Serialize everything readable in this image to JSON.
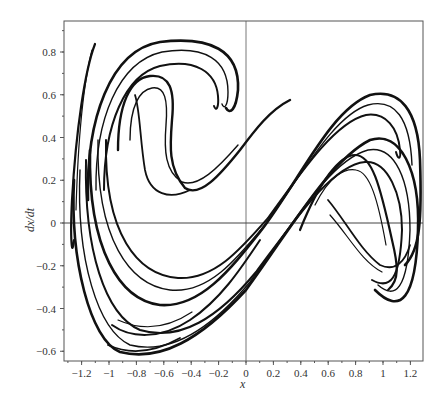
{
  "chart_data": {
    "type": "line",
    "title": "",
    "xlabel": "x",
    "ylabel": "dx/dt",
    "xlim": [
      -1.32,
      1.3
    ],
    "ylim": [
      -0.65,
      0.95
    ],
    "grid": false,
    "legend": null,
    "x_ticks": [
      "-1.2",
      "-1",
      "-0.8",
      "-0.6",
      "-0.4",
      "-0.2",
      "0",
      "0.2",
      "0.4",
      "0.6",
      "0.8",
      "1",
      "1.2"
    ],
    "y_ticks": [
      "-0.6",
      "-0.4",
      "-0.2",
      "0",
      "0.2",
      "0.4",
      "0.6",
      "0.8"
    ],
    "reference_lines": {
      "x": 0,
      "y": 0
    },
    "series": [
      {
        "name": "trajectory-band-outer",
        "x": [
          -1.25,
          -1.28,
          -1.2,
          -1.0,
          -0.8,
          -0.4,
          0.0,
          0.4,
          0.8,
          1.0,
          1.22,
          1.22,
          1.05,
          0.95,
          0.6,
          0.0,
          -0.6,
          -0.85,
          -0.95,
          -0.9,
          -0.7,
          -0.5,
          -0.4
        ],
        "y": [
          0.4,
          0.0,
          -0.35,
          -0.55,
          -0.6,
          -0.45,
          -0.1,
          0.3,
          0.66,
          0.72,
          0.5,
          -0.1,
          -0.2,
          -0.15,
          0.15,
          0.15,
          0.35,
          0.6,
          0.75,
          0.84,
          0.85,
          0.78,
          0.62
        ]
      },
      {
        "name": "trajectory-band-inner",
        "x": [
          -1.1,
          -1.15,
          -1.0,
          -0.8,
          -0.4,
          0.0,
          0.4,
          0.6,
          0.9,
          1.0,
          0.8,
          0.3,
          -0.3,
          -0.7,
          -0.8,
          -0.75,
          -0.7
        ],
        "y": [
          0.2,
          0.0,
          -0.25,
          -0.38,
          -0.3,
          -0.05,
          0.25,
          0.32,
          0.05,
          -0.12,
          -0.05,
          0.12,
          0.15,
          0.3,
          0.5,
          0.68,
          0.72
        ]
      },
      {
        "name": "spike-left",
        "x": [
          -1.28,
          -1.22,
          -1.15
        ],
        "y": [
          0.0,
          0.5,
          0.84
        ]
      }
    ]
  }
}
